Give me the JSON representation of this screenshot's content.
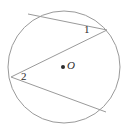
{
  "figure": {
    "type": "circle-with-two-inscribed-angles",
    "background_color": "#ffffff",
    "stroke_color": "#9a9a9a",
    "text_color": "#2b2b2b",
    "labels": {
      "angle_1": "1",
      "angle_2": "2",
      "center": "O"
    },
    "circle": {
      "center_x": 64,
      "center_y": 67,
      "radius": 56
    },
    "center_dot": {
      "x": 63,
      "y": 67,
      "radius": 2
    },
    "chords": [
      {
        "name": "chord-top",
        "x1": 28,
        "y1": 14,
        "x2": 107,
        "y2": 30
      },
      {
        "name": "chord-diagonal",
        "x1": 107,
        "y1": 30,
        "x2": 11,
        "y2": 77
      },
      {
        "name": "chord-bottom",
        "x1": 11,
        "y1": 77,
        "x2": 106,
        "y2": 112
      }
    ]
  }
}
